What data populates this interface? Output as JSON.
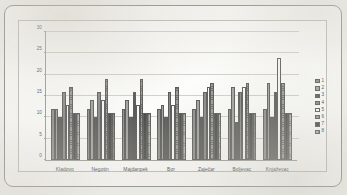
{
  "chart_data": {
    "type": "bar",
    "title": "",
    "xlabel": "",
    "ylabel": "",
    "ylim": [
      0,
      30
    ],
    "yticks": [
      0,
      5,
      10,
      15,
      20,
      25,
      30
    ],
    "grid": true,
    "legend_position": "right",
    "categories": [
      "Kladovo",
      "Negotin",
      "Majdanpek",
      "Bor",
      "Zaječar",
      "Boljevac",
      "Knjaževac"
    ],
    "series": [
      {
        "name": "1",
        "values": [
          12,
          12,
          12,
          12,
          12,
          12,
          12
        ]
      },
      {
        "name": "2",
        "values": [
          12,
          14,
          14,
          13,
          14,
          17,
          18
        ]
      },
      {
        "name": "3",
        "values": [
          10,
          10,
          10,
          10,
          10,
          9,
          10
        ]
      },
      {
        "name": "4",
        "values": [
          16,
          16,
          16,
          16,
          16,
          16,
          16
        ]
      },
      {
        "name": "5",
        "values": [
          13,
          14,
          13,
          13,
          17,
          17,
          24
        ]
      },
      {
        "name": "6",
        "values": [
          17,
          19,
          19,
          17,
          18,
          18,
          18
        ]
      },
      {
        "name": "7",
        "values": [
          11,
          11,
          11,
          11,
          11,
          11,
          11
        ]
      },
      {
        "name": "8",
        "values": [
          11,
          11,
          11,
          11,
          11,
          11,
          11
        ]
      }
    ]
  },
  "legend": {
    "items": [
      {
        "label": "1"
      },
      {
        "label": "2"
      },
      {
        "label": "3"
      },
      {
        "label": "4"
      },
      {
        "label": "5"
      },
      {
        "label": "6"
      },
      {
        "label": "7"
      },
      {
        "label": "8"
      }
    ]
  },
  "colors": {
    "frame": "#8d8d8a",
    "plot_background": "#fdfdfb",
    "gridline": "#d2d1cb",
    "axis": "#9a9a95",
    "text": "#3f3f3d"
  }
}
